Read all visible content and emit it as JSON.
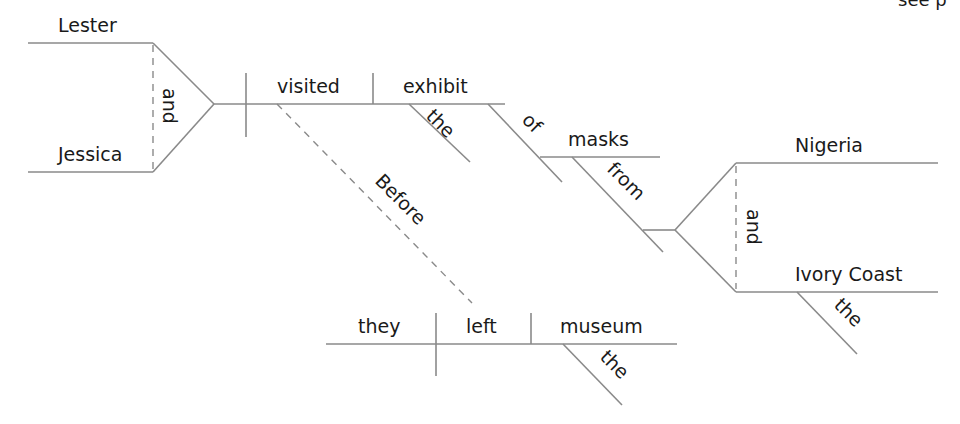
{
  "corner_fragment": "see p",
  "diagram": {
    "type": "sentence-diagram",
    "sentence": "Before they left the museum, Lester and Jessica visited the exhibit of masks from Nigeria and the Ivory Coast.",
    "compound_subject": {
      "words": [
        "Lester",
        "Jessica"
      ],
      "conjunction": "and"
    },
    "verb": "visited",
    "direct_object": {
      "word": "exhibit",
      "modifier": "the"
    },
    "prepositional_phrase_1": {
      "preposition": "of",
      "object": "masks"
    },
    "prepositional_phrase_2": {
      "preposition": "from",
      "compound_object": {
        "words": [
          "Nigeria",
          "Ivory Coast"
        ],
        "conjunction": "and",
        "ivory_coast_modifier": "the"
      }
    },
    "subordinate_clause": {
      "connector": "Before",
      "subject": "they",
      "verb": "left",
      "object": "museum",
      "object_modifier": "the"
    }
  },
  "colors": {
    "line": "#8a8a8a",
    "text": "#1a1a1a",
    "background": "#ffffff"
  }
}
